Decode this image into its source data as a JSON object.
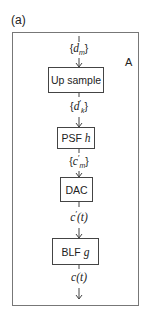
{
  "figure": {
    "panel_label": "(a)",
    "corner_label": "A",
    "input_signal": {
      "prefix": "{",
      "base": "d",
      "sub": "m",
      "prime": "",
      "suffix": "}"
    },
    "blocks": [
      {
        "label": "Up sample",
        "italic": ""
      },
      {
        "label": "PSF ",
        "italic": "h"
      },
      {
        "label": "DAC",
        "italic": ""
      },
      {
        "label": "BLF ",
        "italic": "g"
      }
    ],
    "signals": [
      {
        "prefix": "{",
        "base": "d",
        "prime": "′",
        "sub": "k",
        "suffix": "}"
      },
      {
        "prefix": "{",
        "base": "c",
        "prime": "′",
        "sub": "m",
        "suffix": "}"
      },
      {
        "prefix": "",
        "base": "c",
        "prime": "′",
        "sub": "",
        "suffix": "(t)"
      },
      {
        "prefix": "",
        "base": "c",
        "prime": "",
        "sub": "",
        "suffix": "(t)"
      }
    ],
    "colors": {
      "border": "#777777",
      "block_border": "#444444",
      "text": "#222222",
      "background": "#ffffff"
    }
  }
}
